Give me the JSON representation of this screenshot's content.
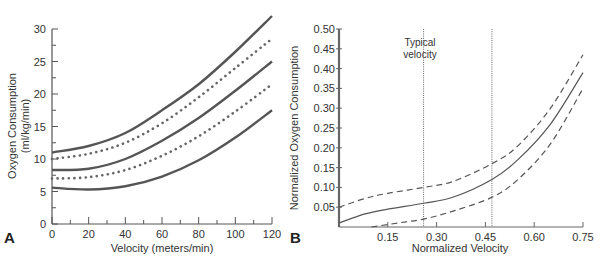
{
  "chart_data": [
    {
      "panel_label": "A",
      "type": "line",
      "title": "",
      "xlabel": "Velocity (meters/min)",
      "ylabel_lines": [
        "Oxygen Consumption",
        "(ml/kg/min)"
      ],
      "xlim": [
        0,
        120
      ],
      "ylim": [
        0,
        30
      ],
      "x_ticks": [
        0,
        20,
        40,
        60,
        80,
        100,
        120
      ],
      "x_minor_step": 10,
      "y_ticks": [
        0,
        5,
        10,
        15,
        20,
        25,
        30
      ],
      "y_minor_step": 2.5,
      "grid": false,
      "x": [
        0,
        20,
        40,
        60,
        80,
        100,
        120
      ],
      "series": [
        {
          "name": "upper-solid",
          "style": "solid",
          "values": [
            11,
            12,
            14,
            17.5,
            21.5,
            26.5,
            32
          ]
        },
        {
          "name": "upper-dotted",
          "style": "dotted",
          "values": [
            10,
            10.8,
            12.5,
            15.5,
            19.5,
            24,
            28.5
          ]
        },
        {
          "name": "middle-solid",
          "style": "solid",
          "values": [
            8.3,
            8.5,
            10,
            12.8,
            16.3,
            20.5,
            25
          ]
        },
        {
          "name": "lower-dotted",
          "style": "dotted",
          "values": [
            7,
            7.2,
            8.3,
            10.5,
            13.5,
            17.3,
            21.5
          ]
        },
        {
          "name": "lower-solid",
          "style": "solid",
          "values": [
            5.6,
            5.3,
            5.8,
            7.3,
            9.8,
            13.3,
            17.5
          ]
        }
      ]
    },
    {
      "panel_label": "B",
      "type": "line",
      "title": "",
      "xlabel": "Normalized Velocity",
      "ylabel": "Normalized Oxygen Consumption",
      "xlim": [
        0,
        0.75
      ],
      "ylim": [
        0,
        0.5
      ],
      "x_ticks": [
        0.15,
        0.3,
        0.45,
        0.6,
        0.75
      ],
      "x_tick_labels": [
        "0.15",
        "0.30",
        "0.45",
        "0.60",
        "0.75"
      ],
      "y_ticks": [
        0.05,
        0.1,
        0.15,
        0.2,
        0.25,
        0.3,
        0.35,
        0.4,
        0.45,
        0.5
      ],
      "y_tick_labels": [
        "0.05",
        "0.10",
        "0.15",
        "0.20",
        "0.25",
        "0.30",
        "0.35",
        "0.40",
        "0.45",
        "0.50"
      ],
      "grid": false,
      "annotation": {
        "text_lines": [
          "Typical",
          "velocity"
        ],
        "x_range": [
          0.26,
          0.47
        ]
      },
      "series": [
        {
          "name": "upper-bound",
          "style": "dashed",
          "x": [
            0,
            0.08,
            0.15,
            0.26,
            0.35,
            0.47,
            0.55,
            0.65,
            0.75
          ],
          "values": [
            0.05,
            0.072,
            0.085,
            0.1,
            0.115,
            0.16,
            0.205,
            0.3,
            0.435
          ]
        },
        {
          "name": "mean",
          "style": "solid",
          "x": [
            0,
            0.08,
            0.15,
            0.26,
            0.35,
            0.47,
            0.55,
            0.65,
            0.75
          ],
          "values": [
            0.01,
            0.033,
            0.045,
            0.06,
            0.075,
            0.12,
            0.17,
            0.26,
            0.39
          ]
        },
        {
          "name": "lower-bound",
          "style": "dashed",
          "x": [
            0.1,
            0.18,
            0.26,
            0.35,
            0.47,
            0.55,
            0.65,
            0.75
          ],
          "values": [
            0,
            0.01,
            0.02,
            0.04,
            0.075,
            0.12,
            0.21,
            0.35
          ]
        }
      ]
    }
  ]
}
